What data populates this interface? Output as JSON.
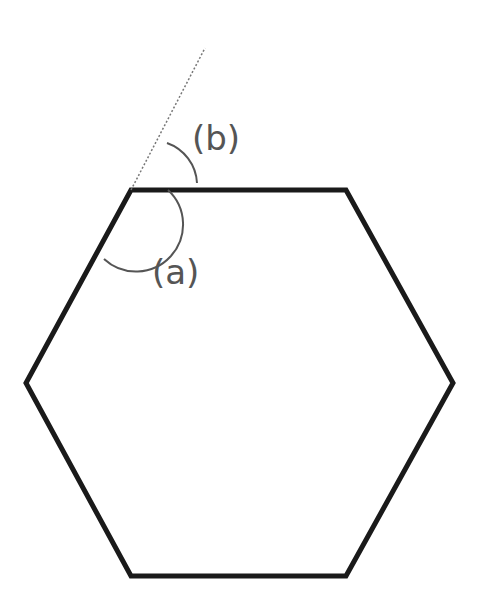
{
  "diagram": {
    "type": "regular-hexagon-angles",
    "shape": "hexagon",
    "vertices": [
      [
        131,
        190
      ],
      [
        346,
        190
      ],
      [
        453,
        383
      ],
      [
        346,
        576
      ],
      [
        131,
        576
      ],
      [
        26,
        383
      ]
    ],
    "extension_line": {
      "from": [
        131,
        190
      ],
      "to": [
        205,
        48
      ],
      "style": "dotted"
    },
    "labels": {
      "a": "(a)",
      "b": "(b)"
    },
    "colors": {
      "stroke": "#1a1a1a",
      "arc": "#555555",
      "text": "#555555",
      "background": "#ffffff"
    }
  }
}
